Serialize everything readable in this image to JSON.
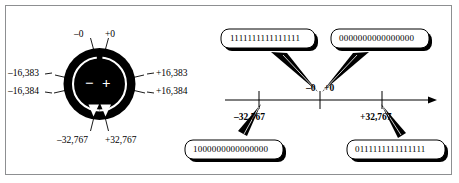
{
  "figure": {
    "title_visible": false,
    "background_color": "#ffffff",
    "frame_color": "#8d8f91",
    "ink_color": "#000000"
  },
  "dial": {
    "name": "signed-integer-wraparound-dial",
    "fill_color": "#000000",
    "marker_color": "#ffffff",
    "center_symbols": {
      "negative": "−",
      "positive": "+"
    },
    "labels": {
      "top_left": "–0",
      "top_right": "+0",
      "left_upper": "–16,383",
      "left_lower": "–16,384",
      "right_upper": "+16,383",
      "right_lower": "+16,384",
      "bottom_left": "–32,767",
      "bottom_right": "+32,767"
    }
  },
  "numberline": {
    "name": "signed-integer-number-line",
    "arrow_direction": "right",
    "ticks": [
      {
        "label": "–32,767",
        "bold": true,
        "position": "below"
      },
      {
        "label": "–0",
        "bold": true,
        "position": "above"
      },
      {
        "label": "+0",
        "bold": true,
        "position": "above"
      },
      {
        "label": "+32,767",
        "bold": true,
        "position": "below"
      }
    ],
    "tick_labels_above": [
      "–0",
      "+0"
    ],
    "tick_labels_below": [
      "–32,767",
      "+32,767"
    ]
  },
  "callouts": [
    {
      "id": "callout-negative-zero",
      "bits": "1111111111111111",
      "bit_count": 16,
      "points_to": "–0",
      "corner": "top-left"
    },
    {
      "id": "callout-positive-zero",
      "bits": "0000000000000000",
      "bit_count": 16,
      "points_to": "+0",
      "corner": "top-right"
    },
    {
      "id": "callout-negative-max",
      "bits": "1000000000000000",
      "bit_count": 16,
      "points_to": "–32,767",
      "corner": "bottom-left"
    },
    {
      "id": "callout-positive-max",
      "bits": "0111111111111111",
      "bit_count": 16,
      "points_to": "+32,767",
      "corner": "bottom-right"
    }
  ]
}
